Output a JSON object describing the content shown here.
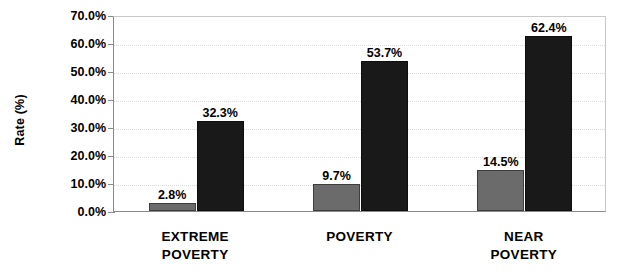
{
  "chart_data": {
    "type": "bar",
    "title": "",
    "subtitle": "",
    "xlabel": "",
    "ylabel": "Rate (%)",
    "categories": [
      "EXTREME\nPOVERTY",
      "POVERTY",
      "NEAR POVERTY"
    ],
    "series": [
      {
        "name": "series-a",
        "color": "#6b6b6b",
        "values": [
          2.8,
          9.7,
          14.5
        ],
        "value_labels": [
          "2.8%",
          "9.7%",
          "14.5%"
        ]
      },
      {
        "name": "series-b",
        "color": "#191919",
        "values": [
          32.3,
          53.7,
          62.4
        ],
        "value_labels": [
          "32.3%",
          "53.7%",
          "62.4%"
        ]
      }
    ],
    "ylim": [
      0,
      70
    ],
    "ytick_values": [
      0,
      10,
      20,
      30,
      40,
      50,
      60,
      70
    ],
    "ytick_labels": [
      "0.0%",
      "10.0%",
      "20.0%",
      "30.0%",
      "40.0%",
      "50.0%",
      "60.0%",
      "70.0%"
    ],
    "grid": true,
    "grid_axis": "y",
    "legend": false,
    "legend_position": "none",
    "value_labels_shown": true,
    "background_color": "#ffffff",
    "axis_color": "#8a8a8a",
    "grid_color": "#dcdcdc",
    "text_color": "#000000"
  },
  "axis": {
    "y_title": "Rate (%)"
  }
}
